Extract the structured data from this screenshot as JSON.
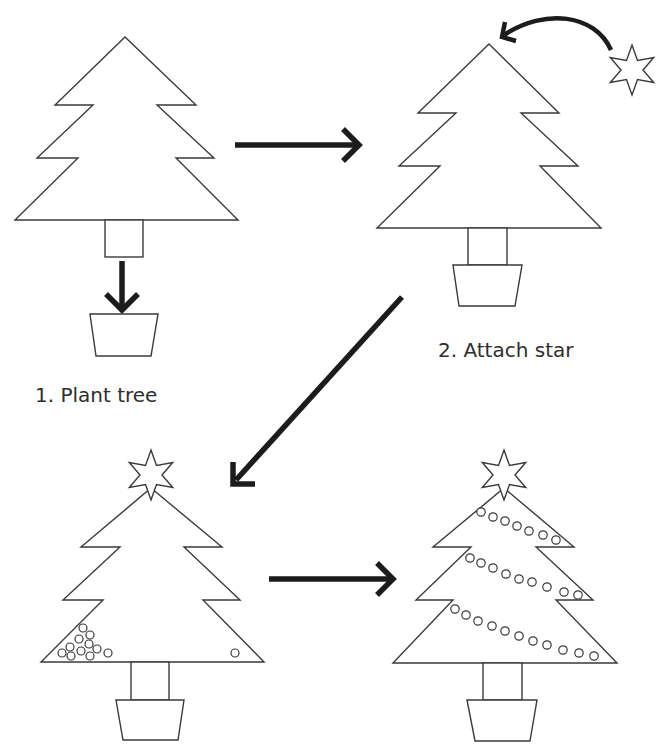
{
  "diagram": {
    "title": "",
    "type": "process-flow",
    "colors": {
      "background": "#ffffff",
      "outline": "#3a3a3a",
      "arrow": "#1c1c1c",
      "text": "#2e2e2e"
    },
    "steps": [
      {
        "id": "step-1",
        "label": "1. Plant tree",
        "description": "Bare tree with trunk; arrow points down into an empty pot",
        "has_star": false,
        "ornaments": 0
      },
      {
        "id": "step-2",
        "label": "2. Attach star",
        "description": "Tree planted in pot; curved arrow moves star to tree top",
        "has_star": false,
        "ornaments": 0
      },
      {
        "id": "step-3",
        "label": "",
        "description": "Tree with star on top and a small cluster of ornaments at lower left",
        "has_star": true,
        "ornaments": 12
      },
      {
        "id": "step-4",
        "label": "",
        "description": "Tree with star and three garlands of beads",
        "has_star": true,
        "garlands": [
          7,
          9,
          11
        ]
      }
    ],
    "connectors": [
      {
        "from": "step-1",
        "to": "step-2",
        "shape": "straight-arrow-right"
      },
      {
        "from": "step-2",
        "to": "step-3",
        "shape": "diagonal-arrow-down-left"
      },
      {
        "from": "step-3",
        "to": "step-4",
        "shape": "straight-arrow-right"
      },
      {
        "from": "loose-star",
        "to": "step-2-treetop",
        "shape": "curved-arrow"
      }
    ],
    "icons": {
      "tree": "fir-tree-outline",
      "pot": "trapezoid-pot",
      "star": "six-point-star",
      "ornament": "small-circle"
    }
  }
}
